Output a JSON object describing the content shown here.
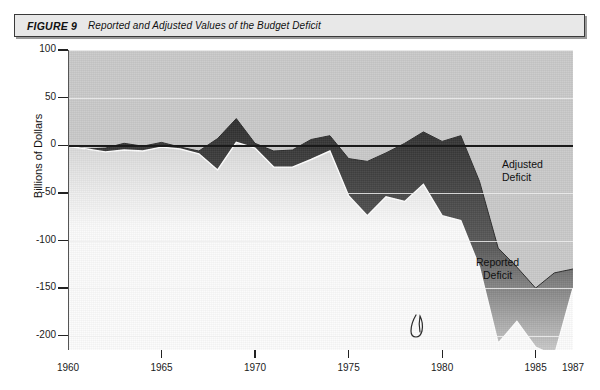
{
  "figure": {
    "label": "FIGURE 9",
    "caption": "Reported and Adjusted Values of the Budget Deficit"
  },
  "annotations": {
    "adjusted": "Adjusted Deficit",
    "reported": "Reported\nDeficit",
    "scribble": "handwritten-mark"
  },
  "colors": {
    "plot_background": "#c9c9c9",
    "band_dark": "#3c3c3c",
    "band_light": "#fbfbfb",
    "gridline": "#ededed",
    "zeroline": "#1a1a1a",
    "title_background": "#e8e8e8"
  },
  "chart_data": {
    "type": "area",
    "title": "Reported and Adjusted Values of the Budget Deficit",
    "xlabel": "",
    "ylabel": "Billions of Dollars",
    "xlim": [
      1960,
      1987
    ],
    "ylim": [
      -215,
      100
    ],
    "yticks": [
      100,
      50,
      0,
      -50,
      -100,
      -150,
      -200
    ],
    "ytick_labels": [
      "100",
      "50",
      "0",
      "-50",
      "-100",
      "-150",
      "-200"
    ],
    "xticks": [
      1960,
      1965,
      1970,
      1975,
      1980,
      1985,
      1987
    ],
    "xtick_labels": [
      "1960",
      "1965",
      "1970",
      "1975",
      "1980",
      "1985",
      "1987"
    ],
    "grid": true,
    "legend": "inline-annotations",
    "x": [
      1960,
      1961,
      1962,
      1963,
      1964,
      1965,
      1966,
      1967,
      1968,
      1969,
      1970,
      1971,
      1972,
      1973,
      1974,
      1975,
      1976,
      1977,
      1978,
      1979,
      1980,
      1981,
      1982,
      1983,
      1984,
      1985,
      1986,
      1987
    ],
    "series": [
      {
        "name": "Adjusted Deficit",
        "values": [
          0,
          -4,
          -3,
          2,
          -1,
          3,
          -2,
          -6,
          7,
          28,
          2,
          -6,
          -5,
          6,
          10,
          -14,
          -17,
          -8,
          2,
          14,
          4,
          10,
          -38,
          -108,
          -128,
          -150,
          -134,
          -130
        ]
      },
      {
        "name": "Reported Deficit",
        "values": [
          -1,
          -4,
          -7,
          -5,
          -6,
          -2,
          -4,
          -9,
          -26,
          3,
          -3,
          -23,
          -23,
          -15,
          -6,
          -53,
          -74,
          -54,
          -59,
          -41,
          -74,
          -79,
          -128,
          -208,
          -185,
          -212,
          -221,
          -150
        ]
      }
    ],
    "note": "Shaded band spans between the Adjusted Deficit (upper) and Reported Deficit (lower) curves."
  }
}
